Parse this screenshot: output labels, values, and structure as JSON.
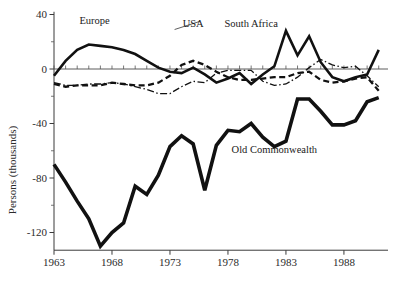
{
  "chart_data": {
    "type": "line",
    "title": "",
    "subtitle": "",
    "xlabel": "",
    "ylabel": "Persons (thousands)",
    "xlim": [
      1963,
      1991
    ],
    "ylim": [
      -135,
      40
    ],
    "grid": false,
    "legend_position": "inline-annotations",
    "x_ticks": [
      "1963",
      "1968",
      "1973",
      "1978",
      "1983",
      "1988"
    ],
    "x_tick_values": [
      1963,
      1968,
      1973,
      1978,
      1983,
      1988
    ],
    "y_ticks": [
      "40",
      "0",
      "-40",
      "-80",
      "-120"
    ],
    "y_tick_values": [
      40,
      0,
      -40,
      -80,
      -120
    ],
    "y_minor_tick_values": [
      20,
      -20,
      -60,
      -100
    ],
    "x": [
      1963,
      1964,
      1965,
      1966,
      1967,
      1968,
      1969,
      1970,
      1971,
      1972,
      1973,
      1974,
      1975,
      1976,
      1977,
      1978,
      1979,
      1980,
      1981,
      1982,
      1983,
      1984,
      1985,
      1986,
      1987,
      1988,
      1989,
      1990,
      1991
    ],
    "series": [
      {
        "name": "Europe",
        "style": "thick-solid",
        "color": "#111111",
        "values": [
          -5,
          6,
          14,
          18,
          17,
          16,
          14,
          11,
          6,
          1,
          -2,
          -3,
          1,
          -4,
          -10,
          -7,
          -3,
          -11,
          -4,
          2,
          28,
          10,
          24,
          5,
          -6,
          -9,
          -6,
          -4,
          14
        ]
      },
      {
        "name": "USA",
        "style": "dashed",
        "color": "#111111",
        "values": [
          -11,
          -13,
          -12,
          -12,
          -12,
          -10,
          -11,
          -12,
          -12,
          -10,
          -5,
          3,
          6,
          3,
          -2,
          -6,
          -8,
          -8,
          -7,
          -6,
          -6,
          -3,
          -2,
          -8,
          -10,
          -9,
          -7,
          -6,
          -16
        ]
      },
      {
        "name": "South Africa",
        "style": "dash-dot",
        "color": "#222222",
        "values": [
          -10,
          -12,
          -12,
          -11,
          -11,
          -10,
          -11,
          -13,
          -15,
          -18,
          -18,
          -13,
          -9,
          -10,
          -3,
          -1,
          -1,
          -1,
          -9,
          -12,
          -11,
          -6,
          1,
          7,
          3,
          1,
          2,
          -5,
          -13
        ]
      },
      {
        "name": "Old Commonwealth",
        "style": "very-thick-solid",
        "color": "#111111",
        "values": [
          -70,
          -83,
          -97,
          -110,
          -130,
          -120,
          -113,
          -86,
          -92,
          -78,
          -57,
          -49,
          -55,
          -89,
          -56,
          -45,
          -46,
          -40,
          -50,
          -57,
          -53,
          -22,
          -22,
          -31,
          -41,
          -41,
          -38,
          -24,
          -21
        ]
      }
    ],
    "annotations": [
      {
        "text": "Europe",
        "x": 1966.5,
        "y": 33,
        "anchor": "middle"
      },
      {
        "text": "USA",
        "x": 1975.0,
        "y": 31,
        "anchor": "middle"
      },
      {
        "text": "South Africa",
        "x": 1980.0,
        "y": 31,
        "anchor": "middle"
      },
      {
        "text": "Old Commonwealth",
        "x": 1982.0,
        "y": -62,
        "anchor": "middle"
      }
    ]
  }
}
